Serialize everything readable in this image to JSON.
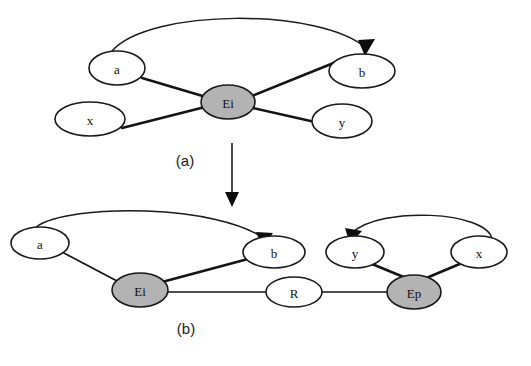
{
  "figure": {
    "background_color": "#ffffff",
    "stroke_color": "#141414",
    "shaded_node_fill": "#b3b3b3",
    "plain_node_fill": "#ffffff",
    "width": 531,
    "height": 366
  },
  "panels": [
    {
      "id": "a",
      "caption": "(a)",
      "nodes": [
        {
          "id": "a_a",
          "label": "a",
          "shaded": false,
          "cx": 117,
          "cy": 68,
          "rx": 28,
          "ry": 17
        },
        {
          "id": "a_x",
          "label": "x",
          "shaded": false,
          "cx": 90,
          "cy": 119,
          "rx": 35,
          "ry": 17
        },
        {
          "id": "a_Ei",
          "label": "Ei",
          "shaded": true,
          "cx": 228,
          "cy": 102,
          "rx": 27,
          "ry": 17
        },
        {
          "id": "a_b",
          "label": "b",
          "shaded": false,
          "cx": 362,
          "cy": 71,
          "rx": 33,
          "ry": 17
        },
        {
          "id": "a_y",
          "label": "y",
          "shaded": false,
          "cx": 342,
          "cy": 121,
          "rx": 30,
          "ry": 17
        }
      ],
      "edges": [
        {
          "from": "a_a",
          "to": "a_Ei",
          "style": "thick"
        },
        {
          "from": "a_x",
          "to": "a_Ei",
          "style": "thick"
        },
        {
          "from": "a_Ei",
          "to": "a_b",
          "style": "thick"
        },
        {
          "from": "a_Ei",
          "to": "a_y",
          "style": "thick"
        }
      ],
      "arcs": [
        {
          "from": "a_a",
          "to": "a_b",
          "directed": true,
          "arrow_at": "to"
        }
      ]
    },
    {
      "id": "b",
      "caption": "(b)",
      "nodes": [
        {
          "id": "b_a",
          "label": "a",
          "shaded": false,
          "cx": 40,
          "cy": 243,
          "rx": 29,
          "ry": 16
        },
        {
          "id": "b_Ei",
          "label": "Ei",
          "shaded": true,
          "cx": 140,
          "cy": 290,
          "rx": 28,
          "ry": 17
        },
        {
          "id": "b_b",
          "label": "b",
          "shaded": false,
          "cx": 274,
          "cy": 252,
          "rx": 31,
          "ry": 16
        },
        {
          "id": "b_R",
          "label": "R",
          "shaded": false,
          "cx": 294,
          "cy": 292,
          "rx": 28,
          "ry": 15
        },
        {
          "id": "b_Ep",
          "label": "Ep",
          "shaded": true,
          "cx": 414,
          "cy": 292,
          "rx": 27,
          "ry": 17
        },
        {
          "id": "b_y",
          "label": "y",
          "shaded": false,
          "cx": 355,
          "cy": 252,
          "rx": 29,
          "ry": 16
        },
        {
          "id": "b_x",
          "label": "x",
          "shaded": false,
          "cx": 479,
          "cy": 252,
          "rx": 28,
          "ry": 16
        }
      ],
      "edges": [
        {
          "from": "b_a",
          "to": "b_Ei",
          "style": "thin"
        },
        {
          "from": "b_Ei",
          "to": "b_b",
          "style": "thick"
        },
        {
          "from": "b_Ei",
          "to": "b_R",
          "style": "thin"
        },
        {
          "from": "b_R",
          "to": "b_Ep",
          "style": "thin"
        },
        {
          "from": "b_y",
          "to": "b_Ep",
          "style": "thick"
        },
        {
          "from": "b_x",
          "to": "b_Ep",
          "style": "thick"
        }
      ],
      "arcs": [
        {
          "from": "b_a",
          "to": "b_b",
          "directed": true,
          "arrow_at": "to"
        },
        {
          "from": "b_x",
          "to": "b_y",
          "directed": true,
          "arrow_at": "to"
        }
      ]
    }
  ],
  "flow": {
    "id": "panel-a-to-panel-b-arrow",
    "description": "vertical transformation arrow",
    "x": 232,
    "y_start": 143,
    "y_end": 206
  }
}
